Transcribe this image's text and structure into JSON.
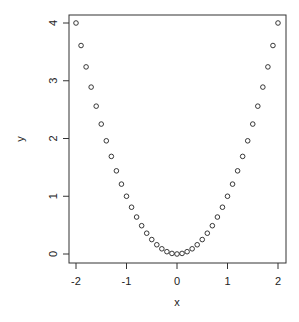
{
  "chart_data": {
    "type": "scatter",
    "title": "",
    "xlabel": "x",
    "ylabel": "y",
    "xlim": [
      -2.16,
      2.16
    ],
    "ylim": [
      -0.16,
      4.16
    ],
    "xticks": [
      -2,
      -1,
      0,
      1,
      2
    ],
    "yticks": [
      0,
      1,
      2,
      3,
      4
    ],
    "xtick_labels": [
      "-2",
      "-1",
      "0",
      "1",
      "2"
    ],
    "ytick_labels": [
      "0",
      "1",
      "2",
      "3",
      "4"
    ],
    "grid": false,
    "legend": null,
    "marker": "open-circle",
    "series": [
      {
        "name": "y = x^2",
        "x": [
          -2.0,
          -1.9,
          -1.8,
          -1.7,
          -1.6,
          -1.5,
          -1.4,
          -1.3,
          -1.2,
          -1.1,
          -1.0,
          -0.9,
          -0.8,
          -0.7,
          -0.6,
          -0.5,
          -0.4,
          -0.3,
          -0.2,
          -0.1,
          0.0,
          0.1,
          0.2,
          0.3,
          0.4,
          0.5,
          0.6,
          0.7,
          0.8,
          0.9,
          1.0,
          1.1,
          1.2,
          1.3,
          1.4,
          1.5,
          1.6,
          1.7,
          1.8,
          1.9,
          2.0
        ],
        "y": [
          4.0,
          3.61,
          3.24,
          2.89,
          2.56,
          2.25,
          1.96,
          1.69,
          1.44,
          1.21,
          1.0,
          0.81,
          0.64,
          0.49,
          0.36,
          0.25,
          0.16,
          0.09,
          0.04,
          0.01,
          0.0,
          0.01,
          0.04,
          0.09,
          0.16,
          0.25,
          0.36,
          0.49,
          0.64,
          0.81,
          1.0,
          1.21,
          1.44,
          1.69,
          1.96,
          2.25,
          2.56,
          2.89,
          3.24,
          3.61,
          4.0
        ]
      }
    ]
  },
  "colors": {
    "axis": "#333333",
    "points": "#222222",
    "background": "#ffffff"
  }
}
